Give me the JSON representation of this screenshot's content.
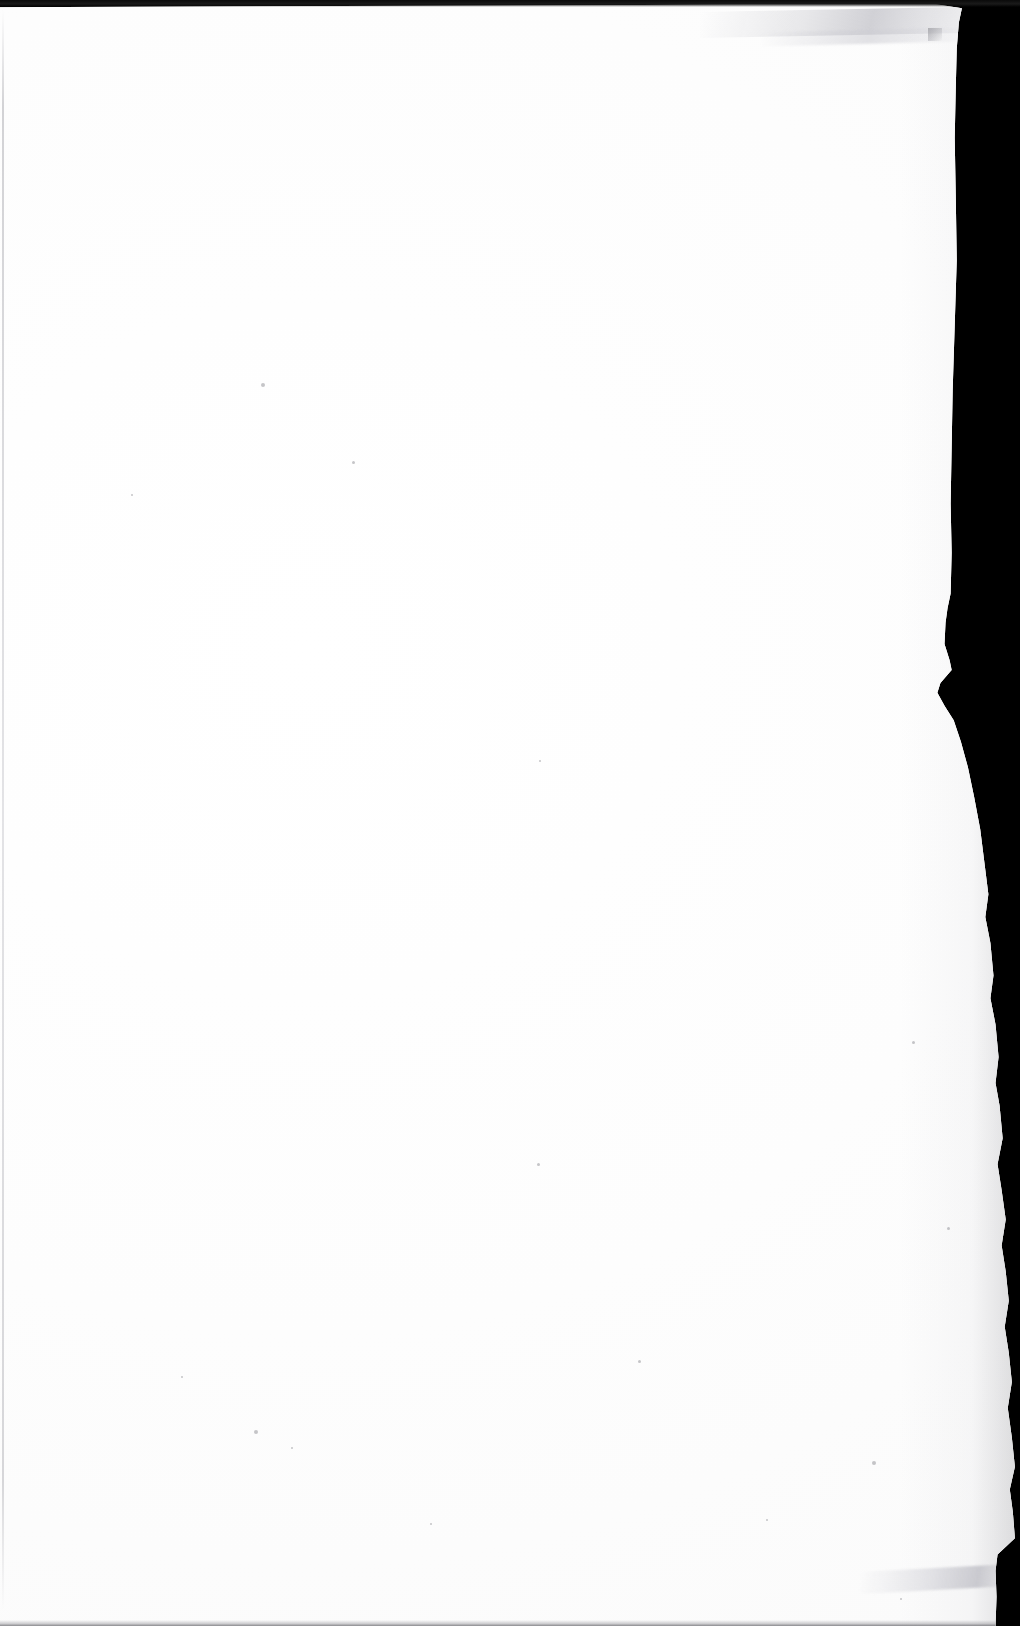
{
  "document": {
    "kind": "scanned-page",
    "page_state": "blank",
    "visible_text": "",
    "orientation": "portrait",
    "width_px": 1020,
    "height_px": 1626
  },
  "colors": {
    "paper": "#ffffff",
    "paper_tone": "#fbfbfb",
    "backdrop": "#000000",
    "edge_shadow": "#8c8c92",
    "crease": "#c6c6cc",
    "speck": "#78787e"
  },
  "features": {
    "top_strip_label": "",
    "left_edge_line_label": "",
    "torn_right_edge_label": "",
    "bottom_shadow_label": "",
    "corner_crease_label": "",
    "bottom_fold_label": ""
  },
  "specks": [
    {
      "x": 261,
      "y": 383,
      "size": 4
    },
    {
      "x": 352,
      "y": 461,
      "size": 3
    },
    {
      "x": 131,
      "y": 494,
      "size": 2
    },
    {
      "x": 539,
      "y": 760,
      "size": 2
    },
    {
      "x": 537,
      "y": 1163,
      "size": 3
    },
    {
      "x": 638,
      "y": 1360,
      "size": 3
    },
    {
      "x": 254,
      "y": 1430,
      "size": 4
    },
    {
      "x": 291,
      "y": 1447,
      "size": 2
    },
    {
      "x": 872,
      "y": 1461,
      "size": 4
    },
    {
      "x": 900,
      "y": 1598,
      "size": 2
    },
    {
      "x": 912,
      "y": 1041,
      "size": 3
    },
    {
      "x": 766,
      "y": 1519,
      "size": 2
    },
    {
      "x": 430,
      "y": 1523,
      "size": 2
    },
    {
      "x": 181,
      "y": 1376,
      "size": 2
    },
    {
      "x": 947,
      "y": 1227,
      "size": 3
    }
  ]
}
